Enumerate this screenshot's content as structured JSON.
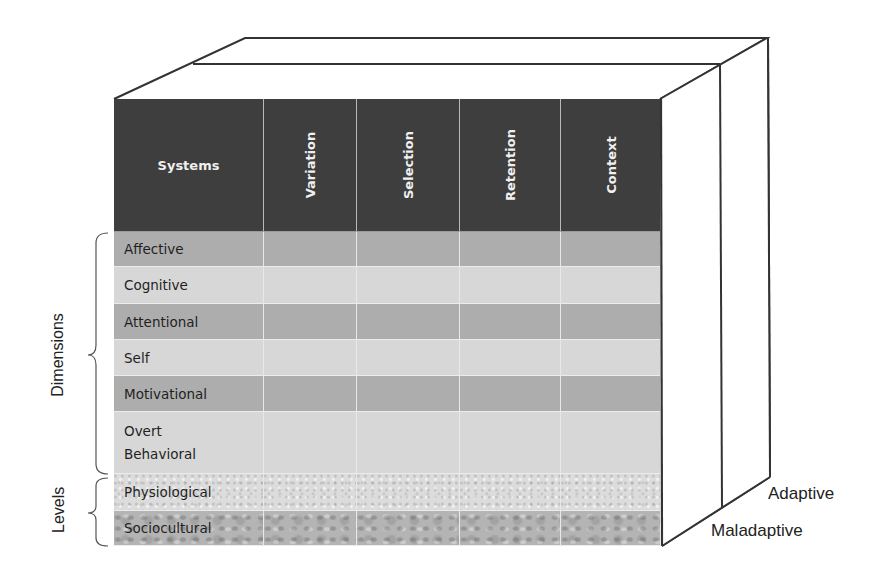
{
  "diagram": {
    "header": {
      "systems_label": "Systems",
      "columns": [
        "Variation",
        "Selection",
        "Retention",
        "Context"
      ]
    },
    "rows": [
      {
        "label": "Affective",
        "group": "Dimensions",
        "shade": "dark"
      },
      {
        "label": "Cognitive",
        "group": "Dimensions",
        "shade": "light"
      },
      {
        "label": "Attentional",
        "group": "Dimensions",
        "shade": "dark"
      },
      {
        "label": "Self",
        "group": "Dimensions",
        "shade": "light"
      },
      {
        "label": "Motivational",
        "group": "Dimensions",
        "shade": "dark"
      },
      {
        "label": "Overt Behavioral",
        "group": "Dimensions",
        "shade": "light"
      },
      {
        "label": "Physiological",
        "group": "Levels",
        "shade": "texture-light"
      },
      {
        "label": "Sociocultural",
        "group": "Levels",
        "shade": "texture-dark"
      }
    ],
    "groups": {
      "dimensions": "Dimensions",
      "levels": "Levels"
    },
    "depth_layers": {
      "front": "Maladaptive",
      "back": "Adaptive"
    },
    "colors": {
      "header_bg": "#3e3e3e",
      "header_text": "#f0f0f0",
      "row_dark": "#adadad",
      "row_light": "#d7d7d7",
      "outline": "#333333"
    }
  }
}
